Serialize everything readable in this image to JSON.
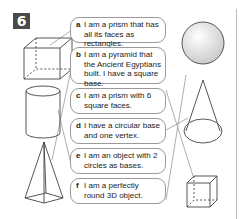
{
  "exercise": {
    "number": "6",
    "badge_color": "#4a4a4a"
  },
  "statements": [
    {
      "letter": "a",
      "text": "I am a prism that has all its faces as rectangles."
    },
    {
      "letter": "b",
      "text": "I am a pyramid that the Ancient Egyptians built. I have a square base."
    },
    {
      "letter": "c",
      "text": "I am a prism with 6 square faces."
    },
    {
      "letter": "d",
      "text": "I have a circular base and one vertex."
    },
    {
      "letter": "e",
      "text": "I am an object with 2 circles as bases."
    },
    {
      "letter": "f",
      "text": "I am a perfectly round 3D object."
    }
  ],
  "shapes": [
    "cuboid",
    "cylinder",
    "square-based-pyramid",
    "sphere",
    "cone",
    "cube"
  ]
}
